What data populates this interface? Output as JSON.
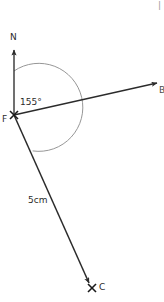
{
  "figure": {
    "type": "bearing-diagram",
    "background_color": "#ffffff",
    "stroke_color": "#2b2b2b",
    "arc_color": "#8a8a8a",
    "labels": {
      "north": "N",
      "vertex": "F",
      "destination": "C",
      "angle": "155°",
      "length": "5cm",
      "ray_end": "B",
      "corner_fragment": "|"
    },
    "points": {
      "F": {
        "x": 14,
        "y": 115,
        "marker": "x-cross"
      },
      "C": {
        "x": 92,
        "y": 288,
        "marker": "x-cross"
      },
      "N_tip": {
        "x": 14,
        "y": 46,
        "marker": "arrowhead"
      },
      "B_tip": {
        "x": 162,
        "y": 82,
        "marker": "arrowhead"
      }
    },
    "segments": [
      {
        "name": "north-line",
        "from": "F",
        "to": "N_tip",
        "arrow": true
      },
      {
        "name": "ray-fb",
        "from": "F",
        "to": "B_tip",
        "arrow": true
      },
      {
        "name": "segment-fc",
        "from": "F",
        "to": "C",
        "arrow": true
      }
    ],
    "arc": {
      "name": "angle-arc-nfc",
      "center": "F",
      "radius": 44,
      "start_label": "north",
      "end_label": "C",
      "measure": "155°"
    }
  }
}
